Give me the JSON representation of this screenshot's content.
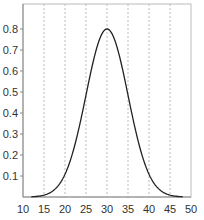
{
  "chart_data": {
    "type": "line",
    "title": "",
    "xlabel": "",
    "ylabel": "",
    "xlim": [
      10,
      50
    ],
    "ylim": [
      0,
      0.9
    ],
    "x_ticks": [
      10,
      15,
      20,
      25,
      30,
      35,
      40,
      45,
      50
    ],
    "y_ticks": [
      0.1,
      0.2,
      0.3,
      0.4,
      0.5,
      0.6,
      0.7,
      0.8
    ],
    "y_tick_labels": [
      "0.1",
      "0.2",
      "0.3",
      "0.4",
      "0.5",
      "0.6",
      "0.7",
      "0.8"
    ],
    "grid": "vertical dashed at x ticks 15-45",
    "legend": null,
    "series": [
      {
        "name": "gaussian",
        "x": [
          12,
          14,
          16,
          18,
          20,
          22,
          24,
          26,
          28,
          30,
          32,
          34,
          36,
          38,
          40,
          42,
          44,
          46,
          48
        ],
        "values": [
          0.001,
          0.005,
          0.016,
          0.045,
          0.108,
          0.222,
          0.389,
          0.581,
          0.739,
          0.8,
          0.739,
          0.581,
          0.389,
          0.222,
          0.108,
          0.045,
          0.016,
          0.005,
          0.001
        ],
        "mean": 30,
        "peak": 0.8,
        "sigma": 5,
        "color": "#222222"
      }
    ]
  }
}
